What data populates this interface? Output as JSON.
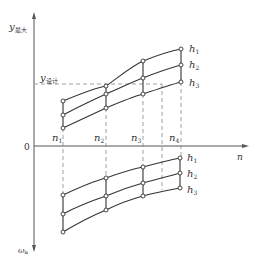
{
  "diagram": {
    "y_axis_label_main": "y",
    "y_axis_label_sub": "最大",
    "y_design_label_main": "y",
    "y_design_label_sub": "设计",
    "origin_label": "0",
    "x_axis_label": "n",
    "bottom_axis_label_main": "ω",
    "bottom_axis_label_sub": "a",
    "n_labels": [
      {
        "main": "n",
        "sub": "1"
      },
      {
        "main": "n",
        "sub": "2"
      },
      {
        "main": "n",
        "sub": "3"
      },
      {
        "main": "n",
        "sub": "4"
      }
    ],
    "upper_curve_labels": [
      {
        "main": "h",
        "sub": "1"
      },
      {
        "main": "h",
        "sub": "2"
      },
      {
        "main": "h",
        "sub": "3"
      }
    ],
    "lower_curve_labels": [
      {
        "main": "h",
        "sub": "1"
      },
      {
        "main": "h",
        "sub": "2"
      },
      {
        "main": "h",
        "sub": "3"
      }
    ]
  }
}
